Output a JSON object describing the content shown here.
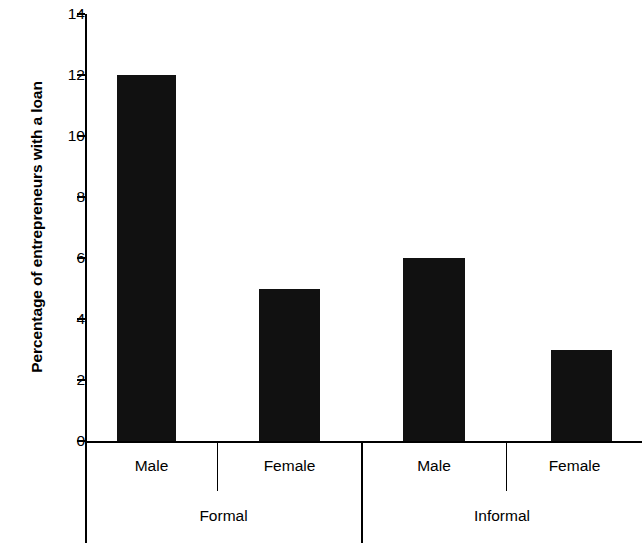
{
  "chart_data": {
    "type": "bar",
    "title": "",
    "subtitle": "",
    "xlabel": "",
    "ylabel": "Percentage of entrepreneurs with a loan",
    "ylim": [
      0,
      14
    ],
    "ytick_values": [
      0,
      2,
      4,
      6,
      8,
      10,
      12,
      14
    ],
    "ytick_labels": [
      "0",
      "2",
      "4",
      "6",
      "8",
      "10",
      "12",
      "14"
    ],
    "grid": false,
    "legend": null,
    "bar_color": "#111111",
    "axis_color": "#000000",
    "background_color": "#ffffff",
    "group_labels": [
      "Formal",
      "Informal"
    ],
    "categories": [
      "Male",
      "Female",
      "Male",
      "Female"
    ],
    "values": [
      12,
      5,
      6,
      3
    ],
    "bars": [
      {
        "group": "Formal",
        "category": "Male",
        "value": 12
      },
      {
        "group": "Formal",
        "category": "Female",
        "value": 5
      },
      {
        "group": "Informal",
        "category": "Male",
        "value": 6
      },
      {
        "group": "Informal",
        "category": "Female",
        "value": 3
      }
    ]
  },
  "axis": {
    "y_label": "Percentage of entrepreneurs with a loan",
    "ticks": [
      {
        "label": "14",
        "value": 14
      },
      {
        "label": "12",
        "value": 12
      },
      {
        "label": "10",
        "value": 10
      },
      {
        "label": "8",
        "value": 8
      },
      {
        "label": "6",
        "value": 6
      },
      {
        "label": "4",
        "value": 4
      },
      {
        "label": "2",
        "value": 2
      },
      {
        "label": "0",
        "value": 0
      }
    ]
  },
  "x_axis": {
    "categories": [
      {
        "label": "Male"
      },
      {
        "label": "Female"
      },
      {
        "label": "Male"
      },
      {
        "label": "Female"
      }
    ],
    "groups": [
      {
        "label": "Formal"
      },
      {
        "label": "Informal"
      }
    ]
  }
}
